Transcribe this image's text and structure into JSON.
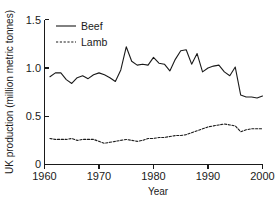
{
  "chart_data": {
    "type": "line",
    "title": "",
    "xlabel": "Year",
    "ylabel": "UK production (million metric tonnes)",
    "xlim": [
      1960,
      2000
    ],
    "ylim": [
      0,
      1.5
    ],
    "xticks": [
      "1960",
      "1970",
      "1980",
      "1990",
      "2000"
    ],
    "xtick_values": [
      1960,
      1970,
      1980,
      1990,
      2000
    ],
    "yticks": [
      "0",
      "0.5",
      "1.0",
      "1.5"
    ],
    "ytick_values": [
      0,
      0.5,
      1.0,
      1.5
    ],
    "grid": false,
    "legend_position": "top-left",
    "x": [
      1961,
      1962,
      1963,
      1964,
      1965,
      1966,
      1967,
      1968,
      1969,
      1970,
      1971,
      1972,
      1973,
      1974,
      1975,
      1976,
      1977,
      1978,
      1979,
      1980,
      1981,
      1982,
      1983,
      1984,
      1985,
      1986,
      1987,
      1988,
      1989,
      1990,
      1991,
      1992,
      1993,
      1994,
      1995,
      1996,
      1997,
      1998,
      1999,
      2000
    ],
    "series": [
      {
        "name": "Beef",
        "style": "solid",
        "color": "#1a1a1a",
        "values": [
          0.91,
          0.95,
          0.95,
          0.88,
          0.84,
          0.9,
          0.92,
          0.89,
          0.93,
          0.95,
          0.93,
          0.9,
          0.86,
          0.98,
          1.22,
          1.07,
          1.03,
          1.04,
          1.03,
          1.11,
          1.05,
          1.04,
          0.97,
          1.09,
          1.18,
          1.19,
          1.04,
          1.15,
          0.96,
          1.0,
          1.02,
          1.03,
          0.96,
          0.92,
          1.01,
          0.72,
          0.7,
          0.7,
          0.69,
          0.71
        ]
      },
      {
        "name": "Lamb",
        "style": "dashed",
        "color": "#1a1a1a",
        "values": [
          0.27,
          0.26,
          0.26,
          0.26,
          0.27,
          0.25,
          0.26,
          0.26,
          0.26,
          0.24,
          0.22,
          0.23,
          0.24,
          0.25,
          0.26,
          0.25,
          0.24,
          0.25,
          0.27,
          0.27,
          0.28,
          0.28,
          0.29,
          0.3,
          0.3,
          0.31,
          0.33,
          0.35,
          0.37,
          0.39,
          0.4,
          0.41,
          0.42,
          0.41,
          0.4,
          0.34,
          0.36,
          0.37,
          0.37,
          0.37
        ]
      }
    ],
    "legend": [
      {
        "label": "Beef",
        "style": "solid"
      },
      {
        "label": "Lamb",
        "style": "dashed"
      }
    ]
  }
}
